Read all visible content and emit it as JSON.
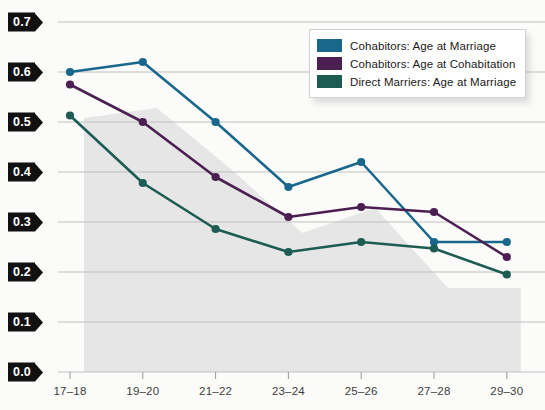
{
  "chart_data": {
    "type": "line",
    "title": "",
    "subtitle": "",
    "xlabel": "",
    "ylabel": "",
    "categories": [
      "17–18",
      "19–20",
      "21–22",
      "23–24",
      "25–26",
      "27–28",
      "29–30"
    ],
    "ylim": [
      0.0,
      0.7
    ],
    "ytick_labels": [
      "0.7",
      "0.6",
      "0.5",
      "0.4",
      "0.3",
      "0.2",
      "0.1",
      "0.0"
    ],
    "ytick_values": [
      0.7,
      0.6,
      0.5,
      0.4,
      0.3,
      0.2,
      0.1,
      0.0
    ],
    "grid": true,
    "legend_position": "top-right",
    "markers": true,
    "series": [
      {
        "name": "Cohabitors: Age at Marriage",
        "color": "#19688c",
        "values": [
          0.6,
          0.62,
          0.5,
          0.37,
          0.42,
          0.26,
          0.26
        ]
      },
      {
        "name": "Cohabitors: Age at Cohabitation",
        "color": "#4c1f52",
        "values": [
          0.575,
          0.5,
          0.39,
          0.31,
          0.33,
          0.32,
          0.23
        ]
      },
      {
        "name": "Direct Marriers: Age at Marriage",
        "color": "#1d5c53",
        "values": [
          0.513,
          0.378,
          0.286,
          0.24,
          0.26,
          0.247,
          0.195
        ]
      }
    ]
  },
  "colors": {
    "background": "#fbfbfa",
    "gridline": "#bfbfbf",
    "axis": "#9a9a9a",
    "tag_background": "#111111",
    "tag_text": "#ffffff",
    "shadow_band": "#e2e2e2"
  }
}
